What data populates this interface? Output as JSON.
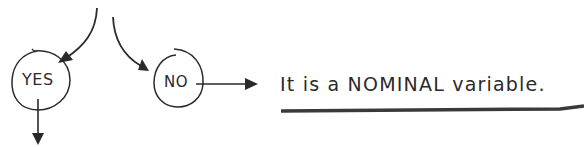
{
  "diagram": {
    "type": "flowchart-fragment",
    "nodes": [
      {
        "id": "yes",
        "label": "YES",
        "shape": "circle"
      },
      {
        "id": "no",
        "label": "NO",
        "shape": "circle"
      }
    ],
    "conclusion": {
      "text": "It is a NOMINAL variable.",
      "underlined": true
    },
    "edges": [
      {
        "from": "above",
        "to": "yes"
      },
      {
        "from": "above",
        "to": "no"
      },
      {
        "from": "no",
        "to": "conclusion"
      },
      {
        "from": "yes",
        "to": "below"
      }
    ],
    "colors": {
      "ink": "#2a2a2a",
      "background": "#ffffff"
    }
  }
}
